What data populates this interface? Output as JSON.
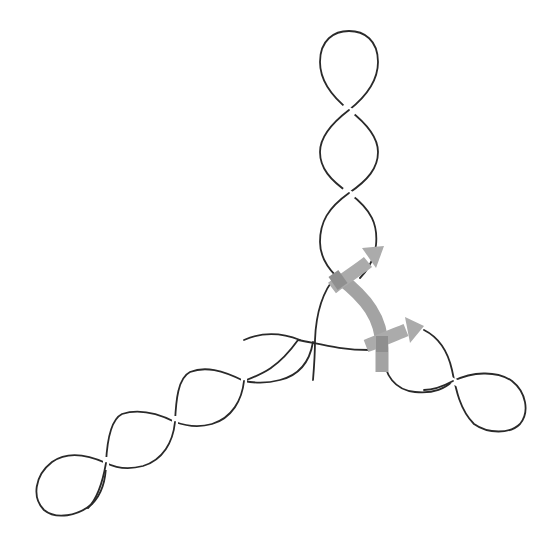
{
  "diagram": {
    "title": "",
    "colors": {
      "background": "#ffffff",
      "strand": "#2a2a2a",
      "arrow": "#a9a9a9",
      "arrow_dark": "#8f8f8f"
    },
    "arms": [
      {
        "name": "top-arm",
        "crossings": 2,
        "end": "loop"
      },
      {
        "name": "lower-left-arm",
        "crossings": 4,
        "end": "loop"
      },
      {
        "name": "right-arm",
        "crossings": 1,
        "end": "loop"
      }
    ],
    "arrows": [
      {
        "name": "upper-arrow",
        "direction": "up-right"
      },
      {
        "name": "lower-arrow",
        "direction": "right"
      }
    ]
  }
}
